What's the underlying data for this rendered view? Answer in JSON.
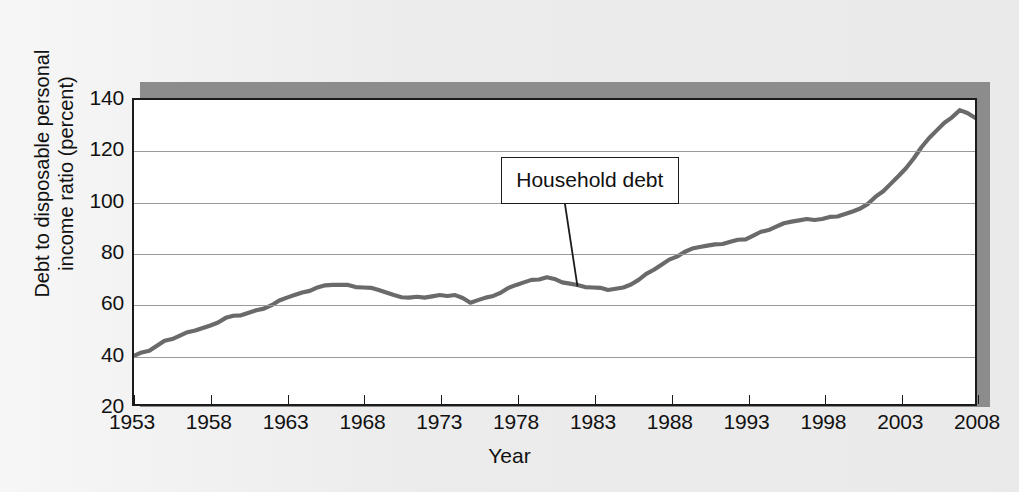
{
  "figure": {
    "annotation_label": "Household debt",
    "colors": {
      "background": "#ececec",
      "plot_background": "#ffffff",
      "frame": "#1b1b1b",
      "shadow": "#8c8c8c",
      "gridline": "#9a9a9a",
      "series": "#6a6a6a"
    }
  },
  "chart_data": {
    "type": "line",
    "title": "",
    "xlabel": "Year",
    "ylabel": "Debt to disposable personal income ratio (percent)",
    "ylabel_lines": [
      "Debt to disposable personal",
      "income ratio (percent)"
    ],
    "xlim": [
      1953,
      2008
    ],
    "ylim": [
      20,
      140
    ],
    "yticks": [
      20,
      40,
      60,
      80,
      100,
      120,
      140
    ],
    "ytick_labels": [
      "20",
      "40",
      "60",
      "80",
      "100",
      "120",
      "140"
    ],
    "gridlines_y": [
      40,
      60,
      80,
      100,
      120
    ],
    "grid": true,
    "legend": false,
    "xticks": [
      1953,
      1958,
      1963,
      1968,
      1973,
      1978,
      1983,
      1988,
      1993,
      1998,
      2003,
      2008
    ],
    "xtick_labels": [
      "1953",
      "1958",
      "1963",
      "1968",
      "1973",
      "1978",
      "1983",
      "1988",
      "1993",
      "1998",
      "2003",
      "2008"
    ],
    "annotations": [
      {
        "text": "Household debt",
        "box_x": 1982.8,
        "box_y": 108,
        "point_x": 1982.0,
        "point_y": 66.5
      }
    ],
    "series": [
      {
        "name": "Household debt",
        "color": "#6a6a6a",
        "x": [
          1953,
          1954,
          1955,
          1956,
          1957,
          1958,
          1959,
          1960,
          1961,
          1962,
          1963,
          1964,
          1965,
          1966,
          1967,
          1968,
          1969,
          1970,
          1971,
          1972,
          1973,
          1974,
          1975,
          1976,
          1977,
          1978,
          1979,
          1980,
          1981,
          1982,
          1983,
          1984,
          1985,
          1986,
          1987,
          1988,
          1989,
          1990,
          1991,
          1992,
          1993,
          1994,
          1995,
          1996,
          1997,
          1998,
          1999,
          2000,
          2001,
          2002,
          2003,
          2004,
          2005,
          2006,
          2007,
          2008
        ],
        "y": [
          39,
          41,
          45,
          47,
          49,
          51,
          54,
          55,
          57,
          59,
          62,
          64,
          66,
          67,
          67,
          66,
          65,
          63,
          62,
          62,
          63,
          63,
          60,
          62,
          64,
          67,
          69,
          70,
          68,
          67,
          66,
          65,
          66,
          69,
          73,
          77,
          80,
          82,
          83,
          84,
          85,
          88,
          90,
          92,
          93,
          93,
          94,
          96,
          99,
          104,
          110,
          117,
          125,
          131,
          136,
          133
        ]
      }
    ]
  }
}
